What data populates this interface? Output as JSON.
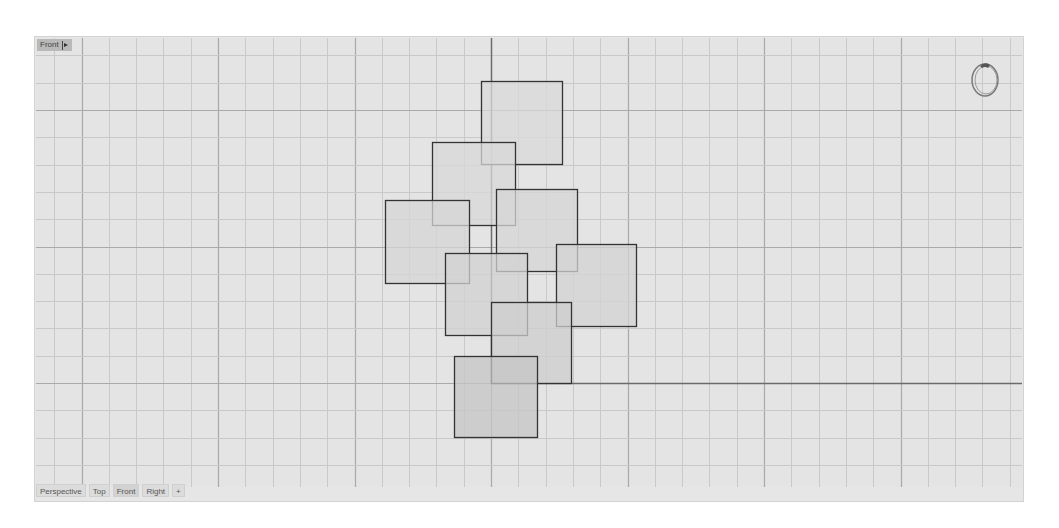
{
  "viewport": {
    "name": "Front",
    "background": "#e4e4e4",
    "grid": {
      "origin_px": [
        491,
        383
      ],
      "minor_step_px": 27.3,
      "major_every": 5,
      "minor_color": "#c9c9c9",
      "major_color": "#a9a9a9",
      "axis_color": "#6b6b6b"
    },
    "squares": [
      {
        "id": "sq1",
        "x": 481,
        "y": 81,
        "w": 81,
        "h": 83,
        "fill": "#dadada"
      },
      {
        "id": "sq2",
        "x": 432,
        "y": 142,
        "w": 83,
        "h": 83,
        "fill": "#d8d8d8"
      },
      {
        "id": "sq3",
        "x": 385,
        "y": 200,
        "w": 84,
        "h": 83,
        "fill": "#d6d6d6"
      },
      {
        "id": "sq4",
        "x": 496,
        "y": 189,
        "w": 81,
        "h": 82,
        "fill": "#d6d6d6"
      },
      {
        "id": "sq5",
        "x": 445,
        "y": 253,
        "w": 82,
        "h": 82,
        "fill": "#d1d1d1"
      },
      {
        "id": "sq6",
        "x": 556,
        "y": 244,
        "w": 80,
        "h": 82,
        "fill": "#d3d3d3"
      },
      {
        "id": "sq7",
        "x": 491,
        "y": 302,
        "w": 80,
        "h": 81,
        "fill": "#cdcdcd"
      },
      {
        "id": "sq8",
        "x": 454,
        "y": 356,
        "w": 83,
        "h": 81,
        "fill": "#c6c6c6"
      }
    ],
    "square_stroke": "#333333"
  },
  "view_label": {
    "text": "Front",
    "dropdown_icon": "triangle-right"
  },
  "tabs": [
    {
      "label": "Perspective",
      "active": false
    },
    {
      "label": "Top",
      "active": false
    },
    {
      "label": "Front",
      "active": true
    },
    {
      "label": "Right",
      "active": false
    },
    {
      "label": "+",
      "active": false
    }
  ],
  "ring_object": {
    "icon": "ring-icon"
  }
}
